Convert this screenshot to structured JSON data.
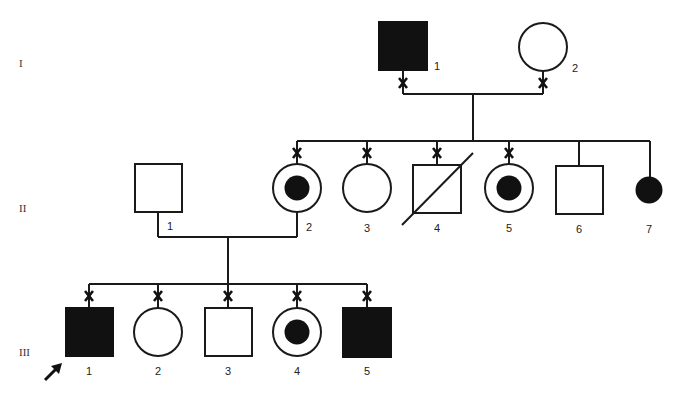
{
  "diagram": {
    "type": "pedigree",
    "colors": {
      "ink": "#111111",
      "background": "#ffffff"
    },
    "generations": [
      {
        "id": "I",
        "label": "I"
      },
      {
        "id": "II",
        "label": "II"
      },
      {
        "id": "III",
        "label": "III"
      }
    ],
    "legend_symbols": {
      "filled_square": "affected male",
      "open_square": "unaffected male",
      "open_circle": "unaffected female",
      "filled_circle": "affected female",
      "circle_with_dot": "carrier female",
      "slash": "deceased",
      "x_mark": "tested / examined",
      "arrow": "proband"
    },
    "individuals": {
      "I": [
        {
          "number": "1",
          "sex": "male",
          "status": "affected",
          "marked_x": true
        },
        {
          "number": "2",
          "sex": "female",
          "status": "unaffected",
          "marked_x": true
        }
      ],
      "II": [
        {
          "number": "1",
          "sex": "male",
          "status": "unaffected",
          "marked_x": false,
          "note": "married-in"
        },
        {
          "number": "2",
          "sex": "female",
          "status": "carrier",
          "marked_x": true
        },
        {
          "number": "3",
          "sex": "female",
          "status": "unaffected",
          "marked_x": true
        },
        {
          "number": "4",
          "sex": "male",
          "status": "unaffected",
          "deceased": true,
          "marked_x": true
        },
        {
          "number": "5",
          "sex": "female",
          "status": "carrier",
          "marked_x": true
        },
        {
          "number": "6",
          "sex": "male",
          "status": "unaffected",
          "marked_x": false
        },
        {
          "number": "7",
          "sex": "female",
          "status": "affected",
          "marked_x": false
        }
      ],
      "III": [
        {
          "number": "1",
          "sex": "male",
          "status": "affected",
          "marked_x": true,
          "proband": true
        },
        {
          "number": "2",
          "sex": "female",
          "status": "unaffected",
          "marked_x": true
        },
        {
          "number": "3",
          "sex": "male",
          "status": "unaffected",
          "marked_x": true
        },
        {
          "number": "4",
          "sex": "female",
          "status": "carrier",
          "marked_x": true
        },
        {
          "number": "5",
          "sex": "male",
          "status": "affected",
          "marked_x": true
        }
      ]
    }
  }
}
